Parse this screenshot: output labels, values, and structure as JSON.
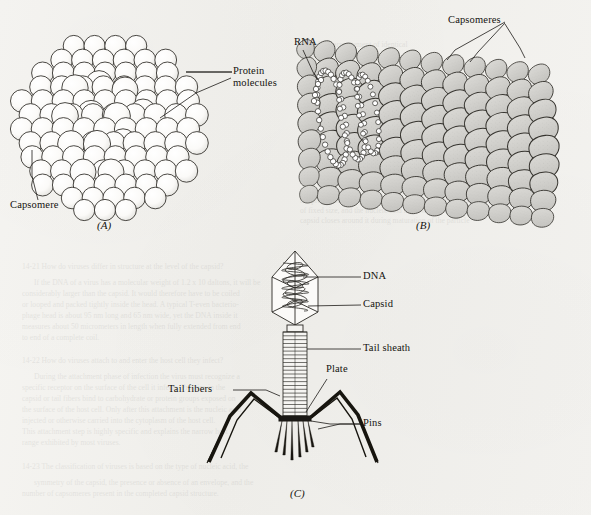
{
  "figure": {
    "background_color": "#f3f2ef",
    "ink_color": "#14130f",
    "capsomere_fill": "#d0cfcb",
    "panels": [
      {
        "id": "A",
        "letter": "(A)",
        "caption": "Icosahedral (polyhedral) virus built from spherical protein capsomeres",
        "labels": [
          "Protein molecules",
          "Capsomere"
        ]
      },
      {
        "id": "B",
        "letter": "(B)",
        "caption": "Helical virus with RNA core surrounded by helically arranged capsomeres",
        "labels": [
          "RNA",
          "Capsomeres"
        ]
      },
      {
        "id": "C",
        "letter": "(C)",
        "caption": "Complex bacteriophage with head, tail sheath and tail fibers",
        "labels": [
          "DNA",
          "Capsid",
          "Tail sheath",
          "Plate",
          "Tail fibers",
          "Pins"
        ]
      }
    ]
  },
  "labels": {
    "protein_molecules_line1": "Protein",
    "protein_molecules_line2": "molecules",
    "capsomere": "Capsomere",
    "rna": "RNA",
    "capsomeres": "Capsomeres",
    "dna": "DNA",
    "capsid": "Capsid",
    "tail_sheath": "Tail sheath",
    "plate": "Plate",
    "tail_fibers": "Tail fibers",
    "pins": "Pins"
  },
  "panel_letters": {
    "a": "(A)",
    "b": "(B)",
    "c": "(C)"
  },
  "background_text": [
    {
      "x": 300,
      "y": 196,
      "text": "the protein subunits assemble spontaneously into a closed shell"
    },
    {
      "x": 300,
      "y": 206,
      "text": "of fixed size, and the nucleic acid is drawn inside as the"
    },
    {
      "x": 300,
      "y": 216,
      "text": "capsid closes around it during maturation of the particle"
    },
    {
      "x": 22,
      "y": 262,
      "text": "14-21  How do viruses differ in structure at the level of the capsid?"
    },
    {
      "x": 34,
      "y": 278,
      "text": "If the DNA of a virus has a molecular weight of 1.2 x 10 daltons, it will be"
    },
    {
      "x": 22,
      "y": 289,
      "text": "considerably larger than the capsid. It would therefore have to be coiled"
    },
    {
      "x": 22,
      "y": 300,
      "text": "or looped and packed tightly inside the head. A typical T-even bacterio-"
    },
    {
      "x": 22,
      "y": 311,
      "text": "phage head is about 95 nm long and 65 nm wide, yet the DNA inside it"
    },
    {
      "x": 22,
      "y": 322,
      "text": "measures about 50 micrometers in length when fully extended from end"
    },
    {
      "x": 22,
      "y": 333,
      "text": "to end of a complete coil."
    },
    {
      "x": 22,
      "y": 356,
      "text": "14-22  How do viruses attach to and enter the host cell they infect?"
    },
    {
      "x": 34,
      "y": 372,
      "text": "During the attachment phase of infection the virus must recognize a"
    },
    {
      "x": 22,
      "y": 383,
      "text": "specific receptor on the surface of the cell it infects. Proteins in the"
    },
    {
      "x": 22,
      "y": 394,
      "text": "capsid or tail fibers bind to carbohydrate or protein groups exposed on"
    },
    {
      "x": 22,
      "y": 405,
      "text": "the surface of the host cell. Only after this attachment is the nucleic acid"
    },
    {
      "x": 22,
      "y": 416,
      "text": "injected or otherwise carried into the cytoplasm of the host cell."
    },
    {
      "x": 22,
      "y": 427,
      "text": "This attachment step is highly specific and explains the narrow host"
    },
    {
      "x": 22,
      "y": 438,
      "text": "range exhibited by most viruses."
    },
    {
      "x": 22,
      "y": 462,
      "text": "14-23  The classification of viruses is based on the type of nucleic acid, the"
    },
    {
      "x": 34,
      "y": 478,
      "text": "symmetry of the capsid, the presence or absence of an envelope, and the"
    },
    {
      "x": 22,
      "y": 489,
      "text": "number of capsomeres present in the completed capsid structure."
    },
    {
      "x": 300,
      "y": 40,
      "text": "the helical arrangement of identical"
    },
    {
      "x": 300,
      "y": 50,
      "text": "subunits around the nucleic acid"
    },
    {
      "x": 460,
      "y": 120,
      "text": "strand produces a rod"
    },
    {
      "x": 460,
      "y": 132,
      "text": "shaped particle"
    }
  ]
}
